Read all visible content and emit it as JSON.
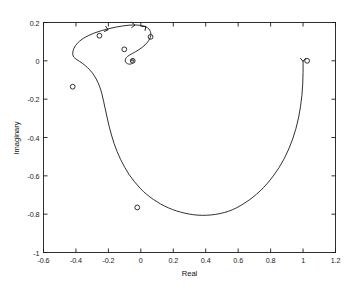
{
  "chart_data": {
    "type": "line",
    "title": "",
    "xlabel": "Real",
    "ylabel": "Imaginary",
    "xlim": [
      -0.6,
      1.2
    ],
    "ylim": [
      -1,
      0.2
    ],
    "xticks": [
      "-0.6",
      "-0.4",
      "-0.2",
      "0",
      "0.2",
      "0.4",
      "0.6",
      "0.8",
      "1",
      "1.2"
    ],
    "xtick_values": [
      -0.6,
      -0.4,
      -0.2,
      0,
      0.2,
      0.4,
      0.6,
      0.8,
      1,
      1.2
    ],
    "yticks": [
      "0.2",
      "0",
      "-0.2",
      "-0.4",
      "-0.6",
      "-0.8",
      "-1"
    ],
    "ytick_values": [
      0.2,
      0,
      -0.2,
      -0.4,
      -0.6,
      -0.8,
      -1
    ],
    "grid": false,
    "legend": "none",
    "line_color": "#1a1a1a",
    "marker_color": "#1a1a1a",
    "marker_symbol": "circle-open",
    "series": [
      {
        "name": "nyquist-spiral",
        "points": [
          [
            1.0,
            0.0
          ],
          [
            1.0,
            -0.06
          ],
          [
            0.998,
            -0.12
          ],
          [
            0.993,
            -0.18
          ],
          [
            0.984,
            -0.24
          ],
          [
            0.972,
            -0.298
          ],
          [
            0.956,
            -0.354
          ],
          [
            0.936,
            -0.408
          ],
          [
            0.912,
            -0.46
          ],
          [
            0.884,
            -0.51
          ],
          [
            0.852,
            -0.557
          ],
          [
            0.816,
            -0.601
          ],
          [
            0.777,
            -0.642
          ],
          [
            0.735,
            -0.679
          ],
          [
            0.69,
            -0.712
          ],
          [
            0.642,
            -0.741
          ],
          [
            0.592,
            -0.766
          ],
          [
            0.54,
            -0.785
          ],
          [
            0.487,
            -0.797
          ],
          [
            0.433,
            -0.804
          ],
          [
            0.379,
            -0.806
          ],
          [
            0.325,
            -0.803
          ],
          [
            0.272,
            -0.795
          ],
          [
            0.22,
            -0.783
          ],
          [
            0.17,
            -0.767
          ],
          [
            0.122,
            -0.747
          ],
          [
            0.077,
            -0.723
          ],
          [
            0.035,
            -0.696
          ],
          [
            -0.004,
            -0.665
          ],
          [
            -0.039,
            -0.631
          ],
          [
            -0.071,
            -0.595
          ],
          [
            -0.099,
            -0.556
          ],
          [
            -0.124,
            -0.516
          ],
          [
            -0.146,
            -0.474
          ],
          [
            -0.165,
            -0.431
          ],
          [
            -0.181,
            -0.387
          ],
          [
            -0.195,
            -0.343
          ],
          [
            -0.207,
            -0.299
          ],
          [
            -0.218,
            -0.256
          ],
          [
            -0.229,
            -0.213
          ],
          [
            -0.24,
            -0.172
          ],
          [
            -0.255,
            -0.132
          ],
          [
            -0.275,
            -0.095
          ],
          [
            -0.3,
            -0.062
          ],
          [
            -0.33,
            -0.034
          ],
          [
            -0.362,
            -0.012
          ],
          [
            -0.394,
            0.006
          ],
          [
            -0.414,
            0.02
          ],
          [
            -0.42,
            0.04
          ],
          [
            -0.412,
            0.066
          ],
          [
            -0.392,
            0.091
          ],
          [
            -0.362,
            0.113
          ],
          [
            -0.325,
            0.131
          ],
          [
            -0.284,
            0.146
          ],
          [
            -0.241,
            0.158
          ],
          [
            -0.197,
            0.168
          ],
          [
            -0.154,
            0.176
          ],
          [
            -0.112,
            0.182
          ],
          [
            -0.072,
            0.186
          ],
          [
            -0.036,
            0.187
          ],
          [
            -0.004,
            0.185
          ],
          [
            0.022,
            0.18
          ],
          [
            0.042,
            0.172
          ],
          [
            0.055,
            0.16
          ],
          [
            0.061,
            0.146
          ],
          [
            0.061,
            0.13
          ],
          [
            0.054,
            0.114
          ],
          [
            0.042,
            0.098
          ],
          [
            0.026,
            0.083
          ],
          [
            0.008,
            0.07
          ],
          [
            -0.012,
            0.058
          ],
          [
            -0.032,
            0.048
          ],
          [
            -0.051,
            0.039
          ],
          [
            -0.068,
            0.031
          ],
          [
            -0.082,
            0.023
          ],
          [
            -0.092,
            0.014
          ],
          [
            -0.096,
            0.004
          ],
          [
            -0.094,
            -0.006
          ],
          [
            -0.086,
            -0.013
          ],
          [
            -0.075,
            -0.017
          ],
          [
            -0.063,
            -0.017
          ],
          [
            -0.053,
            -0.013
          ],
          [
            -0.046,
            -0.007
          ],
          [
            -0.044,
            0.0
          ],
          [
            -0.046,
            0.006
          ],
          [
            -0.051,
            0.009
          ],
          [
            -0.056,
            0.008
          ],
          [
            -0.059,
            0.004
          ],
          [
            -0.058,
            0.0
          ],
          [
            -0.055,
            -0.002
          ],
          [
            -0.052,
            -0.001
          ],
          [
            -0.051,
            0.001
          ]
        ]
      }
    ],
    "markers": [
      {
        "label": "marker-right",
        "x": 1.025,
        "y": 0.0
      },
      {
        "label": "marker-upper-left",
        "x": -0.255,
        "y": 0.131
      },
      {
        "label": "marker-left",
        "x": -0.42,
        "y": -0.135
      },
      {
        "label": "marker-bottom",
        "x": -0.022,
        "y": -0.765
      },
      {
        "label": "marker-inner-upper",
        "x": 0.06,
        "y": 0.125
      },
      {
        "label": "marker-isolated",
        "x": -0.102,
        "y": 0.06
      },
      {
        "label": "marker-spiral-center",
        "x": -0.05,
        "y": 0.0
      }
    ],
    "arrows": [
      {
        "label": "arrow-top-left",
        "x": -0.205,
        "y": 0.163,
        "angle": 15
      },
      {
        "label": "arrow-top-center",
        "x": -0.04,
        "y": 0.187,
        "angle": 0
      },
      {
        "label": "arrow-top-right",
        "x": 0.028,
        "y": 0.178,
        "angle": -40
      },
      {
        "label": "arrow-right-end",
        "x": 1.0,
        "y": 0.0,
        "angle": 90
      }
    ]
  }
}
